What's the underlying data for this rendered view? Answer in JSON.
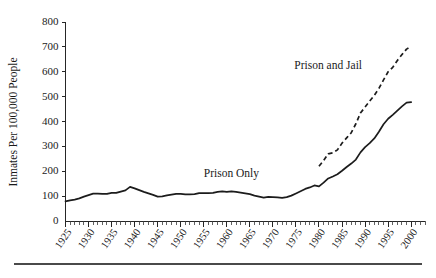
{
  "figure": {
    "background_color": "#ffffff",
    "line_color": "#1c1c1c",
    "text_color": "#1a1a1a",
    "has_bottom_rule": true
  },
  "chart_data": {
    "type": "line",
    "title": "",
    "subtitle": "",
    "xlabel": "",
    "ylabel": "Inmates Per 100,000 People",
    "xlim": [
      1925,
      2003
    ],
    "ylim": [
      0,
      800
    ],
    "grid": false,
    "legend_position": "inline-annotation",
    "y_ticks": [
      0,
      100,
      200,
      300,
      400,
      500,
      600,
      700,
      800
    ],
    "y_tick_labels": [
      "0",
      "100",
      "200",
      "300",
      "400",
      "500",
      "600",
      "700",
      "800"
    ],
    "x_ticks": [
      1925,
      1930,
      1935,
      1940,
      1945,
      1950,
      1955,
      1960,
      1965,
      1970,
      1975,
      1980,
      1985,
      1990,
      1995,
      2000
    ],
    "x_tick_labels": [
      "1925",
      "1930",
      "1935",
      "1940",
      "1945",
      "1950",
      "1955",
      "1960",
      "1965",
      "1970",
      "1975",
      "1980",
      "1985",
      "1990",
      "1995",
      "2000"
    ],
    "x_minor_tick_interval": 1,
    "series": [
      {
        "name": "Prison Only",
        "style": "solid",
        "label_text": "Prison Only",
        "x": [
          1925,
          1926,
          1927,
          1928,
          1929,
          1930,
          1931,
          1932,
          1933,
          1934,
          1935,
          1936,
          1937,
          1938,
          1939,
          1940,
          1941,
          1942,
          1943,
          1944,
          1945,
          1946,
          1947,
          1948,
          1949,
          1950,
          1951,
          1952,
          1953,
          1954,
          1955,
          1956,
          1957,
          1958,
          1959,
          1960,
          1961,
          1962,
          1963,
          1964,
          1965,
          1966,
          1967,
          1968,
          1969,
          1970,
          1971,
          1972,
          1973,
          1974,
          1975,
          1976,
          1977,
          1978,
          1979,
          1980,
          1981,
          1982,
          1983,
          1984,
          1985,
          1986,
          1987,
          1988,
          1989,
          1990,
          1991,
          1992,
          1993,
          1994,
          1995,
          1996,
          1997,
          1998,
          1999,
          2000
        ],
        "y": [
          79,
          83,
          86,
          91,
          98,
          104,
          110,
          110,
          109,
          109,
          113,
          113,
          118,
          123,
          137,
          131,
          124,
          117,
          111,
          105,
          98,
          99,
          103,
          106,
          109,
          109,
          107,
          107,
          108,
          112,
          112,
          112,
          113,
          117,
          119,
          117,
          119,
          117,
          114,
          111,
          108,
          102,
          98,
          94,
          97,
          96,
          95,
          93,
          96,
          102,
          111,
          120,
          129,
          135,
          143,
          139,
          154,
          171,
          179,
          188,
          202,
          217,
          231,
          247,
          276,
          297,
          313,
          332,
          359,
          389,
          411,
          427,
          444,
          461,
          476,
          478
        ],
        "start_value": 79,
        "end_value": 478,
        "peak_1939": 137
      },
      {
        "name": "Prison and Jail",
        "style": "dashed",
        "label_text": "Prison and Jail",
        "x": [
          1980,
          1981,
          1982,
          1983,
          1984,
          1985,
          1986,
          1987,
          1988,
          1989,
          1990,
          1991,
          1992,
          1993,
          1994,
          1995,
          1996,
          1997,
          1998,
          1999,
          2000
        ],
        "y": [
          220,
          243,
          270,
          274,
          286,
          313,
          334,
          355,
          391,
          434,
          458,
          482,
          505,
          533,
          567,
          600,
          618,
          645,
          669,
          691,
          702
        ],
        "start_value": 220,
        "end_value": 702
      }
    ],
    "annotations": [
      {
        "text": "Prison Only",
        "x": 1961,
        "y": 175
      },
      {
        "text": "Prison and Jail",
        "x": 1982,
        "y": 610
      }
    ]
  }
}
